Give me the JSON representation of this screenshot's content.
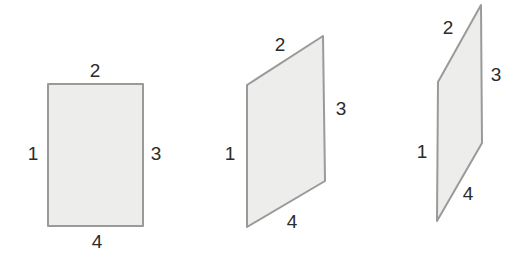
{
  "figure": {
    "background_color": "#ffffff",
    "fill_color": "#ededeb",
    "stroke_color": "#9a9a9a",
    "stroke_width": 2,
    "label_color": "#2b2b2b"
  },
  "shapes": [
    {
      "name": "rectangle",
      "points": "48,84 143,84 143,226 48,226",
      "labels": [
        {
          "text": "1",
          "x": 33,
          "y": 153
        },
        {
          "text": "2",
          "x": 95,
          "y": 70
        },
        {
          "text": "3",
          "x": 156,
          "y": 153
        },
        {
          "text": "4",
          "x": 97,
          "y": 241
        }
      ]
    },
    {
      "name": "parallelogram-medium",
      "points": "247,85 323,36 325,181 247,227",
      "labels": [
        {
          "text": "1",
          "x": 230,
          "y": 153
        },
        {
          "text": "2",
          "x": 280,
          "y": 44
        },
        {
          "text": "3",
          "x": 341,
          "y": 108
        },
        {
          "text": "4",
          "x": 292,
          "y": 221
        }
      ]
    },
    {
      "name": "parallelogram-narrow",
      "points": "438,82 481,5 482,143 437,221",
      "labels": [
        {
          "text": "1",
          "x": 422,
          "y": 151
        },
        {
          "text": "2",
          "x": 448,
          "y": 27
        },
        {
          "text": "3",
          "x": 496,
          "y": 74
        },
        {
          "text": "4",
          "x": 468,
          "y": 193
        }
      ]
    }
  ]
}
